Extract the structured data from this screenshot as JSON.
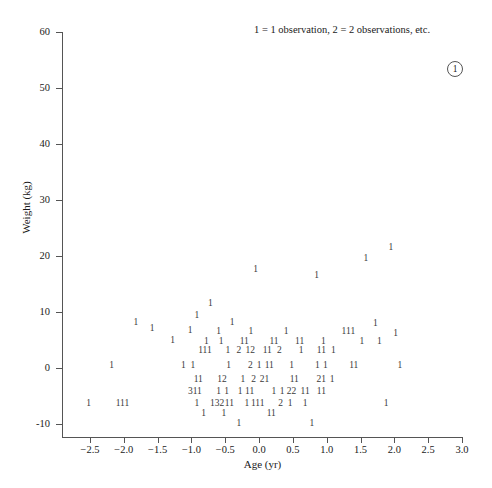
{
  "figure": {
    "background": "#ffffff",
    "ink": "#1a1a1a",
    "axis_color": "#555555",
    "glyph_color": "#3a3a3a"
  },
  "legend": {
    "note": "1 = 1 observation, 2 = 2 observations, etc.",
    "marker_label": "1"
  },
  "chart_data": {
    "type": "scatter",
    "title": "",
    "xlabel": "Age (yr)",
    "ylabel": "Weight (kg)",
    "xlim": [
      -2.75,
      3.0
    ],
    "ylim": [
      -12.5,
      60
    ],
    "grid": false,
    "legend_position": "top-right",
    "annotation": "1 = 1 observation, 2 = 2 observations, etc.",
    "marker_encoding": "digit indicates number of overlapping observations",
    "xticks": [
      "-2.5",
      "-2.0",
      "-1.5",
      "-1.0",
      "-0.5",
      "0.0",
      "0.5",
      "1.0",
      "1.5",
      "2.0",
      "2.5",
      "3.0"
    ],
    "xtick_values": [
      -2.5,
      -2.0,
      -1.5,
      -1.0,
      -0.5,
      0.0,
      0.5,
      1.0,
      1.5,
      2.0,
      2.5,
      3.0
    ],
    "yticks": [
      "60",
      "50",
      "40",
      "30",
      "20",
      "10",
      "0",
      "-10"
    ],
    "ytick_values": [
      60,
      50,
      40,
      30,
      20,
      10,
      0,
      -10
    ],
    "points": [
      {
        "x": 1.95,
        "y": 21.5,
        "label": "1"
      },
      {
        "x": 1.58,
        "y": 19.5,
        "label": "1"
      },
      {
        "x": -0.05,
        "y": 17.5,
        "label": "1"
      },
      {
        "x": 0.85,
        "y": 16.5,
        "label": "1"
      },
      {
        "x": -0.72,
        "y": 11.5,
        "label": "1"
      },
      {
        "x": -0.92,
        "y": 9.2,
        "label": "1"
      },
      {
        "x": -1.82,
        "y": 8.0,
        "label": "1"
      },
      {
        "x": -0.4,
        "y": 8.0,
        "label": "1"
      },
      {
        "x": 1.72,
        "y": 7.8,
        "label": "1"
      },
      {
        "x": -1.58,
        "y": 7.0,
        "label": "1"
      },
      {
        "x": -1.02,
        "y": 6.6,
        "label": "1"
      },
      {
        "x": -0.6,
        "y": 6.4,
        "label": "1"
      },
      {
        "x": -0.12,
        "y": 6.4,
        "label": "1"
      },
      {
        "x": 0.4,
        "y": 6.4,
        "label": "1"
      },
      {
        "x": 1.32,
        "y": 6.4,
        "label": "111"
      },
      {
        "x": 2.02,
        "y": 6.0,
        "label": "1"
      },
      {
        "x": -1.28,
        "y": 4.9,
        "label": "1"
      },
      {
        "x": -0.78,
        "y": 4.6,
        "label": "1"
      },
      {
        "x": -0.56,
        "y": 4.6,
        "label": "1"
      },
      {
        "x": -0.22,
        "y": 4.6,
        "label": "11"
      },
      {
        "x": 0.22,
        "y": 4.6,
        "label": "11"
      },
      {
        "x": 0.6,
        "y": 4.6,
        "label": "11"
      },
      {
        "x": 0.95,
        "y": 4.6,
        "label": "1"
      },
      {
        "x": 1.52,
        "y": 4.6,
        "label": "1"
      },
      {
        "x": 1.78,
        "y": 4.6,
        "label": "1"
      },
      {
        "x": -0.8,
        "y": 3.0,
        "label": "111"
      },
      {
        "x": -0.46,
        "y": 3.0,
        "label": "1"
      },
      {
        "x": -0.3,
        "y": 3.0,
        "label": "2"
      },
      {
        "x": -0.13,
        "y": 3.0,
        "label": "12"
      },
      {
        "x": 0.12,
        "y": 3.0,
        "label": "11"
      },
      {
        "x": 0.3,
        "y": 3.0,
        "label": "2"
      },
      {
        "x": 0.62,
        "y": 3.0,
        "label": "1"
      },
      {
        "x": 0.92,
        "y": 3.0,
        "label": "11"
      },
      {
        "x": 1.1,
        "y": 3.0,
        "label": "1"
      },
      {
        "x": -2.18,
        "y": 0.3,
        "label": "1"
      },
      {
        "x": -1.12,
        "y": 0.3,
        "label": "1"
      },
      {
        "x": -0.98,
        "y": 0.3,
        "label": "1"
      },
      {
        "x": -0.45,
        "y": 0.3,
        "label": "1"
      },
      {
        "x": -0.13,
        "y": 0.3,
        "label": "2"
      },
      {
        "x": 0.0,
        "y": 0.3,
        "label": "1"
      },
      {
        "x": 0.15,
        "y": 0.3,
        "label": "11"
      },
      {
        "x": 0.48,
        "y": 0.3,
        "label": "1"
      },
      {
        "x": 0.86,
        "y": 0.3,
        "label": "1"
      },
      {
        "x": 0.98,
        "y": 0.3,
        "label": "1"
      },
      {
        "x": 1.4,
        "y": 0.3,
        "label": "11"
      },
      {
        "x": 2.08,
        "y": 0.3,
        "label": "1"
      },
      {
        "x": -0.9,
        "y": -2.1,
        "label": "11"
      },
      {
        "x": -0.55,
        "y": -2.1,
        "label": "12"
      },
      {
        "x": -0.24,
        "y": -2.1,
        "label": "1"
      },
      {
        "x": -0.08,
        "y": -2.1,
        "label": "2"
      },
      {
        "x": 0.08,
        "y": -2.1,
        "label": "21"
      },
      {
        "x": 0.52,
        "y": -2.1,
        "label": "11"
      },
      {
        "x": 0.92,
        "y": -2.1,
        "label": "21"
      },
      {
        "x": 1.08,
        "y": -2.1,
        "label": "1"
      },
      {
        "x": -0.95,
        "y": -4.2,
        "label": "311"
      },
      {
        "x": -0.6,
        "y": -4.2,
        "label": "1"
      },
      {
        "x": -0.48,
        "y": -4.2,
        "label": "1"
      },
      {
        "x": -0.28,
        "y": -4.2,
        "label": "1"
      },
      {
        "x": -0.14,
        "y": -4.2,
        "label": "11"
      },
      {
        "x": 0.22,
        "y": -4.2,
        "label": "1"
      },
      {
        "x": 0.34,
        "y": -4.2,
        "label": "1"
      },
      {
        "x": 0.48,
        "y": -4.2,
        "label": "22"
      },
      {
        "x": 0.68,
        "y": -4.2,
        "label": "11"
      },
      {
        "x": 0.92,
        "y": -4.2,
        "label": "11"
      },
      {
        "x": -2.52,
        "y": -6.5,
        "label": "1"
      },
      {
        "x": -2.02,
        "y": -6.5,
        "label": "111"
      },
      {
        "x": -0.92,
        "y": -6.5,
        "label": "1"
      },
      {
        "x": -0.62,
        "y": -6.5,
        "label": "132"
      },
      {
        "x": -0.44,
        "y": -6.5,
        "label": "11"
      },
      {
        "x": -0.18,
        "y": -6.5,
        "label": "1"
      },
      {
        "x": -0.02,
        "y": -6.5,
        "label": "111"
      },
      {
        "x": 0.32,
        "y": -6.5,
        "label": "2"
      },
      {
        "x": 0.46,
        "y": -6.5,
        "label": "1"
      },
      {
        "x": 0.68,
        "y": -6.5,
        "label": "1"
      },
      {
        "x": 1.88,
        "y": -6.5,
        "label": "1"
      },
      {
        "x": -0.82,
        "y": -8.2,
        "label": "1"
      },
      {
        "x": -0.52,
        "y": -8.2,
        "label": "1"
      },
      {
        "x": 0.18,
        "y": -8.2,
        "label": "11"
      },
      {
        "x": -0.3,
        "y": -10.0,
        "label": "1"
      },
      {
        "x": 0.78,
        "y": -10.0,
        "label": "1"
      }
    ]
  }
}
